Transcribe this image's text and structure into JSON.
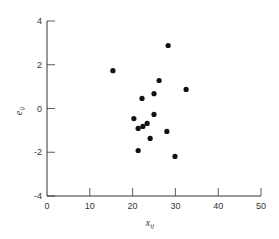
{
  "chart_data": {
    "type": "scatter",
    "title": "",
    "xlabel": "x_ij",
    "ylabel": "e_ij",
    "xlim": [
      0,
      50
    ],
    "ylim": [
      -4,
      4
    ],
    "xticks": [
      0,
      10,
      20,
      30,
      40,
      50
    ],
    "yticks": [
      -4,
      -2,
      0,
      2,
      4
    ],
    "grid": false,
    "legend": null,
    "series": [
      {
        "name": "residuals",
        "color": "#111111",
        "points": [
          {
            "x": 15.4,
            "y": 1.73
          },
          {
            "x": 28.3,
            "y": 2.88
          },
          {
            "x": 26.2,
            "y": 1.28
          },
          {
            "x": 32.5,
            "y": 0.87
          },
          {
            "x": 25.0,
            "y": 0.68
          },
          {
            "x": 22.2,
            "y": 0.46
          },
          {
            "x": 20.3,
            "y": -0.46
          },
          {
            "x": 25.0,
            "y": -0.27
          },
          {
            "x": 21.3,
            "y": -0.91
          },
          {
            "x": 22.4,
            "y": -0.82
          },
          {
            "x": 23.4,
            "y": -0.68
          },
          {
            "x": 28.0,
            "y": -1.05
          },
          {
            "x": 24.1,
            "y": -1.37
          },
          {
            "x": 21.3,
            "y": -1.92
          },
          {
            "x": 29.9,
            "y": -2.19
          }
        ]
      }
    ]
  },
  "labels": {
    "x_main": "x",
    "x_sub": "ij",
    "y_main": "e",
    "y_sub": "ij"
  }
}
